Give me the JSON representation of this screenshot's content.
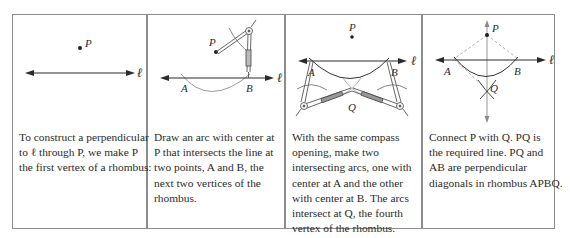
{
  "figure": {
    "panels": [
      {
        "id": 1,
        "labels": {
          "point_p": "P",
          "line": "ℓ"
        },
        "caption_lines": [
          "To construct a perpendicular",
          "to ℓ through  P,  we make P",
          "the first vertex of a rhombus:"
        ]
      },
      {
        "id": 2,
        "labels": {
          "point_p": "P",
          "point_a": "A",
          "point_b": "B",
          "line": "ℓ"
        },
        "caption_lines": [
          "Draw an arc with center at",
          "P that intersects the line at",
          "two points,  A and B, the",
          "next two vertices of the",
          "rhombus."
        ]
      },
      {
        "id": 3,
        "labels": {
          "point_p": "P",
          "point_a": "A",
          "point_b": "B",
          "point_q": "Q",
          "line": "ℓ"
        },
        "caption_lines": [
          "With the same compass",
          "opening, make two",
          "intersecting arcs, one with",
          "center at  A  and the other",
          "with center at B. The arcs",
          "intersect at  Q, the fourth",
          "vertex of the rhombus."
        ]
      },
      {
        "id": 4,
        "labels": {
          "point_p": "P",
          "point_a": "A",
          "point_b": "B",
          "point_q": "Q",
          "line": "ℓ"
        },
        "caption_lines": [
          "Connect  P with Q.  PQ is",
          "the required line.  PQ and",
          "AB are perpendicular",
          "diagonals in rhombus APBQ."
        ]
      }
    ],
    "colors": {
      "border": "#8c8c8c",
      "ink": "#2b2b2b",
      "arc_light": "#9a9a9a",
      "dashed": "#a8a8a8"
    }
  }
}
